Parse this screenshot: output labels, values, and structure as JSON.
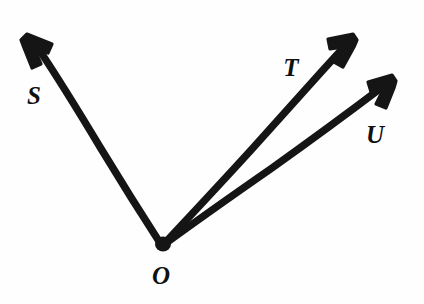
{
  "figure": {
    "background_color": "#fefefe",
    "ink_color": "#151515",
    "stroke_width": 7.4,
    "canvas": {
      "width": 424,
      "height": 304
    },
    "vertex": {
      "name": "O",
      "label": "O",
      "x": 162,
      "y": 246,
      "label_x": 161,
      "label_y": 284
    },
    "rays": [
      {
        "id": "ray-os",
        "name": "OS",
        "label": "S",
        "from_x": 162,
        "from_y": 246,
        "to_x": 32,
        "to_y": 42,
        "mid_x": 98,
        "mid_y": 146,
        "tip_x": 28,
        "tip_y": 35,
        "label_x": 34,
        "label_y": 104,
        "direction": "upper-left"
      },
      {
        "id": "ray-ot",
        "name": "OT",
        "label": "T",
        "from_x": 162,
        "from_y": 246,
        "to_x": 342,
        "to_y": 48,
        "mid_x": 253,
        "mid_y": 148,
        "tip_x": 352,
        "tip_y": 36,
        "label_x": 291,
        "label_y": 76,
        "direction": "upper-right"
      },
      {
        "id": "ray-ou",
        "name": "OU",
        "label": "U",
        "from_x": 162,
        "from_y": 246,
        "to_x": 378,
        "to_y": 87,
        "mid_x": 271,
        "mid_y": 168,
        "tip_x": 391,
        "tip_y": 77,
        "label_x": 375,
        "label_y": 143,
        "direction": "right-upper"
      }
    ],
    "labels": [
      {
        "text": "S",
        "x": 34,
        "y": 104
      },
      {
        "text": "T",
        "x": 291,
        "y": 76
      },
      {
        "text": "U",
        "x": 375,
        "y": 143
      },
      {
        "text": "O",
        "x": 161,
        "y": 284
      }
    ]
  }
}
